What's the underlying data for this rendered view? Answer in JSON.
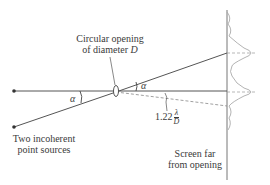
{
  "labels": {
    "opening_line1": "Circular opening",
    "opening_line2_prefix": "of diameter ",
    "opening_symbol": "D",
    "alpha_source": "α",
    "alpha_opening": "α",
    "resolution_coeff": "1.22",
    "resolution_num": "λ",
    "resolution_den": "D",
    "sources_line1": "Two incoherent",
    "sources_line2": "point sources",
    "screen_line1": "Screen far",
    "screen_line2": "from opening"
  },
  "colors": {
    "line": "#555555",
    "dashed": "#888888",
    "profile": "#aaaaaa",
    "text": "#3a3a3a"
  }
}
